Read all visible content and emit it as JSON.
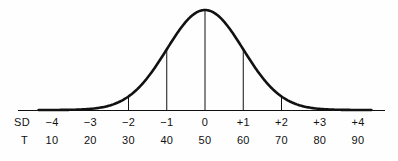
{
  "figure": {
    "name": "normal-distribution-curve",
    "background_color": "#fefefe",
    "line_color": "#111111",
    "text_color": "#111111"
  },
  "axis": {
    "baseline_y": 110,
    "baseline_x_start": 18,
    "baseline_x_end": 385,
    "first_tick_x": 52,
    "tick_spacing": 38.25
  },
  "rows": {
    "sd_key": "SD",
    "t_key": "T"
  },
  "chart_data": {
    "type": "line",
    "title": "",
    "subtitle": "",
    "xlabel": "",
    "ylabel": "",
    "grid": false,
    "legend": "none",
    "curve": "normal distribution (bell curve)",
    "mean": 0,
    "peak_t_score": 50,
    "xlim": [
      -4.4,
      4.4
    ],
    "ylim": [
      0,
      1
    ],
    "categories": [
      "-4",
      "-3",
      "-2",
      "-1",
      "0",
      "+1",
      "+2",
      "+3",
      "+4"
    ],
    "series": [
      {
        "name": "Standard deviations (SD)",
        "values": [
          -4,
          -3,
          -2,
          -1,
          0,
          1,
          2,
          3,
          4
        ]
      },
      {
        "name": "T scores",
        "values": [
          10,
          20,
          30,
          40,
          50,
          60,
          70,
          80,
          90
        ]
      },
      {
        "name": "Normal density (relative height)",
        "values": [
          0.0003,
          0.011,
          0.135,
          0.607,
          1.0,
          0.607,
          0.135,
          0.011,
          0.0003
        ]
      }
    ],
    "sd_labels": [
      "−4",
      "−3",
      "−2",
      "−1",
      "0",
      "+1",
      "+2",
      "+3",
      "+4"
    ],
    "t_labels": [
      "10",
      "20",
      "30",
      "40",
      "50",
      "60",
      "70",
      "80",
      "90"
    ],
    "vertical_ordinates_at": [
      -4,
      -3,
      -2,
      -1,
      0,
      1,
      2,
      3,
      4
    ]
  }
}
